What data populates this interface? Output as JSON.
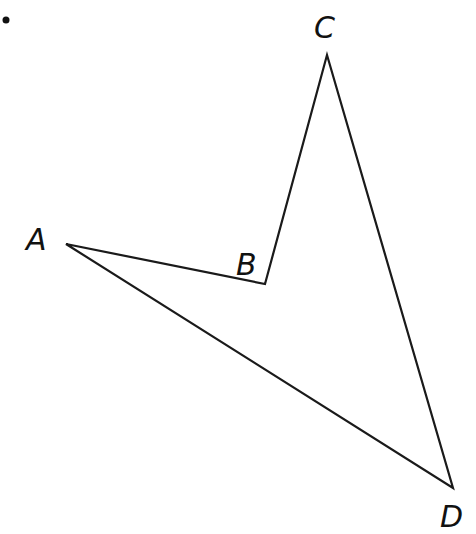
{
  "problem_number_fragment": ".",
  "figure": {
    "type": "quadrilateral",
    "stroke_color": "#1a1a1a",
    "vertices": [
      {
        "name": "A",
        "x": 66,
        "y": 244,
        "label_x": 26,
        "label_y": 248
      },
      {
        "name": "B",
        "x": 265,
        "y": 284,
        "label_x": 236,
        "label_y": 273
      },
      {
        "name": "C",
        "x": 327,
        "y": 55,
        "label_x": 314,
        "label_y": 38
      },
      {
        "name": "D",
        "x": 453,
        "y": 488,
        "label_x": 440,
        "label_y": 527
      }
    ],
    "edges": [
      [
        "A",
        "B"
      ],
      [
        "B",
        "C"
      ],
      [
        "C",
        "D"
      ],
      [
        "D",
        "A"
      ]
    ]
  },
  "labels": {
    "A": "A",
    "B": "B",
    "C": "C",
    "D": "D"
  }
}
